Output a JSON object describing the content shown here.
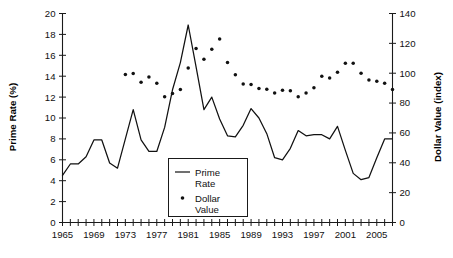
{
  "chart_data": {
    "type": "line",
    "title": "",
    "xlabel": "",
    "ylabel": "Prime Rate (%)",
    "y2label": "Dollar Value (index)",
    "grid": false,
    "legend_position": "center",
    "xlim": [
      1965,
      2007
    ],
    "ylim": [
      0,
      20
    ],
    "y2lim": [
      0,
      140
    ],
    "x_ticks_every": 1,
    "x_tick_labels": [
      "1965",
      "1969",
      "1973",
      "1977",
      "1981",
      "1985",
      "1989",
      "1993",
      "1997",
      "2001",
      "2005"
    ],
    "x_tick_label_years": [
      1965,
      1969,
      1973,
      1977,
      1981,
      1985,
      1989,
      1993,
      1997,
      2001,
      2005
    ],
    "y_tick_labels": [
      "0",
      "2",
      "4",
      "6",
      "8",
      "10",
      "12",
      "14",
      "16",
      "18",
      "20"
    ],
    "y_tick_values": [
      0,
      2,
      4,
      6,
      8,
      10,
      12,
      14,
      16,
      18,
      20
    ],
    "y2_tick_labels": [
      "0",
      "20",
      "40",
      "60",
      "80",
      "100",
      "120",
      "140"
    ],
    "y2_tick_values": [
      0,
      20,
      40,
      60,
      80,
      100,
      120,
      140
    ],
    "x": [
      1965,
      1966,
      1967,
      1968,
      1969,
      1970,
      1971,
      1972,
      1973,
      1974,
      1975,
      1976,
      1977,
      1978,
      1979,
      1980,
      1981,
      1982,
      1983,
      1984,
      1985,
      1986,
      1987,
      1988,
      1989,
      1990,
      1991,
      1992,
      1993,
      1994,
      1995,
      1996,
      1997,
      1998,
      1999,
      2000,
      2001,
      2002,
      2003,
      2004,
      2005,
      2006,
      2007
    ],
    "series": [
      {
        "name": "Prime Rate",
        "axis": "left",
        "style": "line",
        "units": "%",
        "values": [
          4.5,
          5.6,
          5.6,
          6.3,
          7.9,
          7.9,
          5.7,
          5.2,
          8.0,
          10.8,
          7.9,
          6.8,
          6.8,
          9.1,
          12.7,
          15.3,
          18.9,
          14.9,
          10.8,
          12.0,
          9.9,
          8.3,
          8.2,
          9.3,
          10.9,
          10.0,
          8.5,
          6.2,
          6.0,
          7.1,
          8.8,
          8.3,
          8.4,
          8.4,
          8.0,
          9.2,
          6.9,
          4.7,
          4.1,
          4.3,
          6.2,
          8.0,
          8.0
        ]
      },
      {
        "name": "Dollar Value",
        "axis": "right",
        "style": "dots",
        "units": "index",
        "x_start": 1973,
        "values": [
          null,
          null,
          null,
          null,
          null,
          null,
          null,
          null,
          99.1,
          99.8,
          93.9,
          97.4,
          93.2,
          84.3,
          86.4,
          89.1,
          103.5,
          116.6,
          109.3,
          116.0,
          123.0,
          107.2,
          98.9,
          92.7,
          92.5,
          89.8,
          89.2,
          86.7,
          88.6,
          88.3,
          84.2,
          86.7,
          90.2,
          97.9,
          96.8,
          100.6,
          106.7,
          106.7,
          99.9,
          95.4,
          94.7,
          93.3,
          89.1
        ]
      }
    ]
  },
  "legend": {
    "entries": [
      {
        "label_line1": "Prime",
        "label_line2": "Rate",
        "marker": "line-swatch"
      },
      {
        "label_line1": "Dollar",
        "label_line2": "Value",
        "marker": "dot-swatch"
      }
    ]
  },
  "colors": {
    "line": "#111111",
    "dot": "#111111",
    "axis": "#1a1a1a",
    "background": "#ffffff"
  }
}
